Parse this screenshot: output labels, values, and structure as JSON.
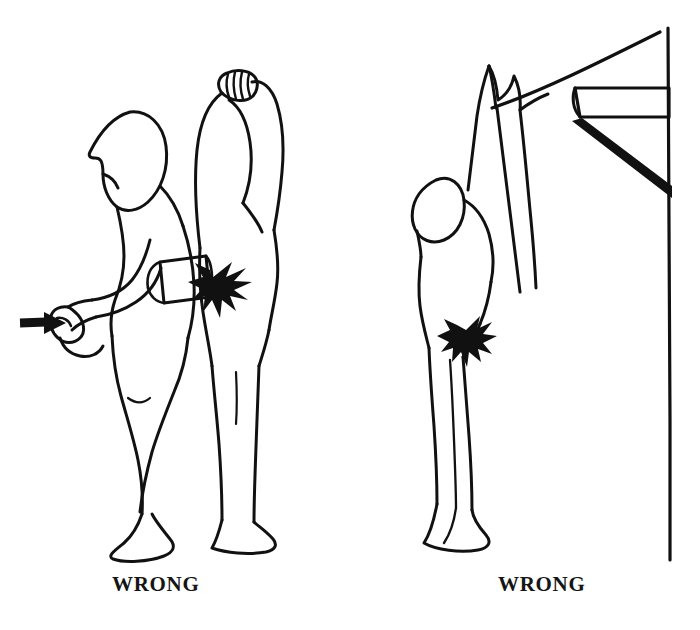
{
  "sheet": {
    "width": 700,
    "height": 630,
    "background_color": "#ffffff",
    "ink_color": "#111111",
    "stroke_width": 3.0,
    "style": "pen-and-ink line drawing, unshaded outline figures"
  },
  "captions": {
    "left": "WRONG",
    "right": "WRONG"
  },
  "panels": [
    {
      "id": "left-panel",
      "caption": "WRONG",
      "subject_count": 2,
      "description": "Two standing nude figures in profile facing left; the rear figure raises one arm with a clenched fist above the head while an injector device pressed against the hip fires, indicated by a starburst at the contact point; a second hand grips the device with a solid arrow pointing into the fist from the left.",
      "elements": [
        {
          "name": "front-figure",
          "pose": "standing profile facing left, head bowed forward, arms down and forward"
        },
        {
          "name": "rear-figure",
          "pose": "standing profile facing left, one arm raised overhead with clenched fist"
        },
        {
          "name": "injector-device",
          "shape": "rectangular barrel held horizontally against the hip"
        },
        {
          "name": "impact-starburst",
          "meaning": "injection discharge at skin contact point"
        },
        {
          "name": "direction-arrow",
          "fill": "solid black",
          "points": "right"
        },
        {
          "name": "clenched-fist-raised",
          "detail": "knuckle and finger crease lines"
        }
      ]
    },
    {
      "id": "right-panel",
      "caption": "WRONG",
      "subject_count": 1,
      "description": "A single standing nude figure in profile facing left, both arms stretched straight overhead gripping the underside of a wall-mounted shelf bracket; a starburst marks an injection discharge low on the buttock.",
      "elements": [
        {
          "name": "standing-figure",
          "pose": "standing profile facing left, both arms reaching vertically overhead"
        },
        {
          "name": "gripping-hands",
          "detail": "two hands curled over the shelf edge"
        },
        {
          "name": "wall-shelf",
          "shape": "horizontal plank attached to vertical wall"
        },
        {
          "name": "shelf-brace",
          "shape": "solid black diagonal support strut"
        },
        {
          "name": "wall-line",
          "shape": "vertical line at right edge"
        },
        {
          "name": "impact-starburst",
          "meaning": "injection discharge at buttock"
        }
      ]
    }
  ]
}
